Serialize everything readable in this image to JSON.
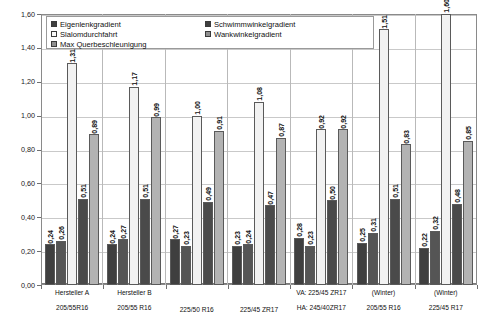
{
  "chart_data": {
    "type": "bar",
    "title": "",
    "xlabel": "",
    "ylabel": "",
    "ylim": [
      0.0,
      1.6
    ],
    "ytick_step": 0.2,
    "grid": true,
    "legend_position": "top-inside",
    "number_format": "german-comma",
    "yticks": [
      "1,60",
      "1,40",
      "1,20",
      "1,00",
      "0,80",
      "0,60",
      "0,40",
      "0,20",
      "0,00"
    ],
    "ytick_values": [
      1.6,
      1.4,
      1.2,
      1.0,
      0.8,
      0.6,
      0.4,
      0.2,
      0.0
    ],
    "categories": [
      "Hersteller A\n205/55R16",
      "Hersteller B\n205/55 R16",
      "225/50 R16",
      "225/45 ZR17",
      "VA: 225/45 ZR17\nHA: 245/40ZR17",
      "(Winter)\n205/55 R16",
      "(Winter)\n225/45 R17"
    ],
    "category_lines": [
      {
        "line1": "Hersteller A",
        "line2": "205/55R16"
      },
      {
        "line1": "Hersteller B",
        "line2": "205/55 R16"
      },
      {
        "line1": "",
        "line2": "225/50 R16"
      },
      {
        "line1": "",
        "line2": "225/45 ZR17"
      },
      {
        "line1": "VA: 225/45 ZR17",
        "line2": "HA: 245/40ZR17"
      },
      {
        "line1": "(Winter)",
        "line2": "205/55 R16"
      },
      {
        "line1": "(Winter)",
        "line2": "225/45 R17"
      }
    ],
    "series": [
      {
        "name": "Eigenlenkgradient",
        "color": "#3f3f3f",
        "values": [
          0.24,
          0.24,
          0.27,
          0.23,
          0.28,
          0.25,
          0.22
        ],
        "labels": [
          "0,24",
          "0,24",
          "0,27",
          "0,23",
          "0,28",
          "0,25",
          "0,22"
        ]
      },
      {
        "name": "Slalomdurchfahrt",
        "color": "#555555",
        "values": [
          0.26,
          0.27,
          0.23,
          0.24,
          0.23,
          0.31,
          0.32
        ],
        "labels": [
          "0,26",
          "0,27",
          "0,23",
          "0,24",
          "0,23",
          "0,31",
          "0,32"
        ]
      },
      {
        "name": "Max Querbeschleunigung",
        "color": "#f2f2f2",
        "values": [
          1.31,
          1.17,
          1.0,
          1.08,
          0.92,
          1.51,
          1.6
        ],
        "labels": [
          "1,31",
          "1,17",
          "1,00",
          "1,08",
          "0,92",
          "1,51",
          "1,60"
        ]
      },
      {
        "name": "Schwimmwinkelgradient",
        "color": "#4a4a4a",
        "values": [
          0.51,
          0.51,
          0.49,
          0.47,
          0.5,
          0.51,
          0.48
        ],
        "labels": [
          "0,51",
          "0,51",
          "0,49",
          "0,47",
          "0,50",
          "0,51",
          "0,48"
        ]
      },
      {
        "name": "Wankwinkelgradient",
        "color": "#b3b3b3",
        "values": [
          0.89,
          0.99,
          0.91,
          0.87,
          0.92,
          0.83,
          0.85
        ],
        "labels": [
          "0,89",
          "0,99",
          "0,91",
          "0,87",
          "0,92",
          "0,83",
          "0,85"
        ]
      }
    ]
  },
  "legend": {
    "left_column": [
      {
        "label": "Eigenlenkgradient",
        "color": "#3f3f3f"
      },
      {
        "label": "Slalomdurchfahrt",
        "color": "#fafafa"
      },
      {
        "label": "Max Querbeschleunigung",
        "color": "#8f8f8f"
      }
    ],
    "right_column": [
      {
        "label": "Schwimmwinkelgradient",
        "color": "#3f3f3f"
      },
      {
        "label": "Wankwinkelgradient",
        "color": "#8f8f8f"
      }
    ]
  }
}
